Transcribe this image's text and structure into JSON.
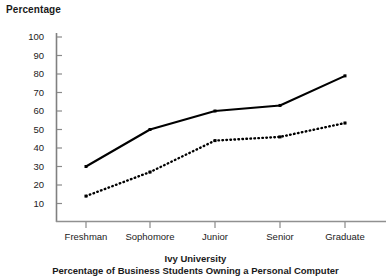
{
  "chart_data": {
    "type": "line",
    "title": "Ivy University",
    "subtitle": "Percentage of Business Students Owning a Personal Computer",
    "xlabel": "",
    "ylabel": "Percentage",
    "categories": [
      "Freshman",
      "Sophomore",
      "Junior",
      "Senior",
      "Graduate"
    ],
    "ylim": [
      0,
      100
    ],
    "yticks": [
      10,
      20,
      30,
      40,
      50,
      60,
      70,
      80,
      90,
      100
    ],
    "grid": false,
    "legend": "none",
    "series": [
      {
        "name": "solid-series",
        "style": "solid",
        "color": "#000000",
        "values": [
          30,
          50,
          60,
          63,
          79
        ]
      },
      {
        "name": "dotted-series",
        "style": "dotted",
        "color": "#000000",
        "values": [
          14,
          27,
          44,
          46,
          53.5
        ]
      }
    ]
  },
  "labels": {
    "y_axis_title": "Percentage",
    "y_100": "100",
    "y_90": "90",
    "y_80": "80",
    "y_70": "70",
    "y_60": "60",
    "y_50": "50",
    "y_40": "40",
    "y_30": "30",
    "y_20": "20",
    "y_10": "10",
    "x_freshman": "Freshman",
    "x_sophomore": "Sophomore",
    "x_junior": "Junior",
    "x_senior": "Senior",
    "x_graduate": "Graduate",
    "caption_line1": "Ivy University",
    "caption_line2": "Percentage of Business Students Owning a Personal Computer"
  }
}
